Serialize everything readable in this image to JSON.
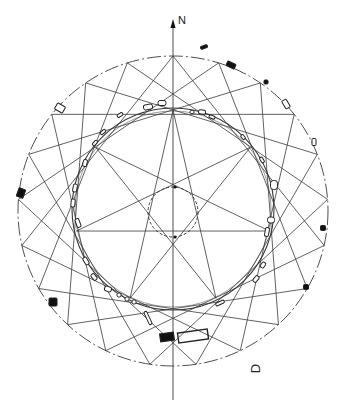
{
  "labels": {
    "north": "N",
    "corner_letter": "D"
  },
  "geometry": {
    "center": [
      173,
      211
    ],
    "outer_radius": 155,
    "outer_points": 21,
    "outer_chord_step": 6,
    "outer_rotation_deg": 0,
    "inner_ring_radius": 101,
    "star_points": 7,
    "star_step": 3,
    "star_rotation_deg": 0,
    "center_circle_radius": 25,
    "axis": {
      "x": 173,
      "y_top": 22,
      "y_bottom": 400
    },
    "north_arrow": {
      "x": 173,
      "y": 22
    }
  },
  "colors": {
    "line": "#3a3a3a",
    "stone_fill": "#111111",
    "stone_outline": "#222222",
    "background": "#ffffff"
  },
  "outer_stones": [
    {
      "x": 204,
      "y": 47,
      "w": 7,
      "h": 3,
      "rot": -20,
      "filled": true
    },
    {
      "x": 231,
      "y": 65,
      "w": 9,
      "h": 5,
      "rot": 25,
      "filled": true
    },
    {
      "x": 266,
      "y": 82,
      "w": 4,
      "h": 4,
      "rot": 0,
      "filled": true
    },
    {
      "x": 286,
      "y": 104,
      "w": 5,
      "h": 9,
      "rot": -30,
      "filled": false
    },
    {
      "x": 314,
      "y": 142,
      "w": 4,
      "h": 7,
      "rot": 0,
      "filled": false
    },
    {
      "x": 323,
      "y": 228,
      "w": 5,
      "h": 5,
      "rot": 0,
      "filled": true
    },
    {
      "x": 306,
      "y": 287,
      "w": 5,
      "h": 5,
      "rot": 0,
      "filled": true
    },
    {
      "x": 21,
      "y": 193,
      "w": 7,
      "h": 9,
      "rot": 20,
      "filled": true
    },
    {
      "x": 60,
      "y": 108,
      "w": 9,
      "h": 7,
      "rot": 30,
      "filled": false
    },
    {
      "x": 53,
      "y": 302,
      "w": 8,
      "h": 8,
      "rot": 0,
      "filled": true
    }
  ],
  "inner_stones": [
    {
      "x": 148,
      "y": 107,
      "w": 9,
      "h": 5,
      "rot": -10
    },
    {
      "x": 162,
      "y": 103,
      "w": 8,
      "h": 5,
      "rot": 0
    },
    {
      "x": 192,
      "y": 112,
      "w": 4,
      "h": 3,
      "rot": 0
    },
    {
      "x": 202,
      "y": 112,
      "w": 7,
      "h": 4,
      "rot": 10
    },
    {
      "x": 212,
      "y": 117,
      "w": 6,
      "h": 3,
      "rot": 20
    },
    {
      "x": 120,
      "y": 115,
      "w": 6,
      "h": 3,
      "rot": -30
    },
    {
      "x": 103,
      "y": 132,
      "w": 6,
      "h": 3,
      "rot": -40
    },
    {
      "x": 95,
      "y": 143,
      "w": 6,
      "h": 3,
      "rot": -50
    },
    {
      "x": 85,
      "y": 163,
      "w": 4,
      "h": 7,
      "rot": 15
    },
    {
      "x": 75,
      "y": 188,
      "w": 4,
      "h": 8,
      "rot": 10
    },
    {
      "x": 73,
      "y": 203,
      "w": 4,
      "h": 8,
      "rot": 5
    },
    {
      "x": 78,
      "y": 223,
      "w": 4,
      "h": 9,
      "rot": -20
    },
    {
      "x": 86,
      "y": 261,
      "w": 4,
      "h": 8,
      "rot": -30
    },
    {
      "x": 94,
      "y": 277,
      "w": 4,
      "h": 7,
      "rot": -40
    },
    {
      "x": 108,
      "y": 289,
      "w": 7,
      "h": 5,
      "rot": 20
    },
    {
      "x": 119,
      "y": 295,
      "w": 4,
      "h": 4,
      "rot": 0
    },
    {
      "x": 127,
      "y": 299,
      "w": 4,
      "h": 4,
      "rot": 0
    },
    {
      "x": 134,
      "y": 302,
      "w": 4,
      "h": 4,
      "rot": 0
    },
    {
      "x": 148,
      "y": 318,
      "w": 3,
      "h": 14,
      "rot": -25
    },
    {
      "x": 220,
      "y": 303,
      "w": 9,
      "h": 3,
      "rot": -25
    },
    {
      "x": 256,
      "y": 279,
      "w": 4,
      "h": 7,
      "rot": 40
    },
    {
      "x": 263,
      "y": 265,
      "w": 4,
      "h": 6,
      "rot": 35
    },
    {
      "x": 267,
      "y": 232,
      "w": 4,
      "h": 9,
      "rot": 10
    },
    {
      "x": 271,
      "y": 220,
      "w": 7,
      "h": 6,
      "rot": 0
    },
    {
      "x": 274,
      "y": 185,
      "w": 7,
      "h": 9,
      "rot": 0
    },
    {
      "x": 262,
      "y": 160,
      "w": 3,
      "h": 6,
      "rot": -30
    },
    {
      "x": 243,
      "y": 137,
      "w": 3,
      "h": 5,
      "rot": -40
    }
  ],
  "feature_block": {
    "x": 178,
    "y": 331,
    "w": 30,
    "h": 10,
    "rot": -8,
    "filled_part": {
      "x": 160,
      "y": 333,
      "w": 14,
      "h": 8
    }
  }
}
